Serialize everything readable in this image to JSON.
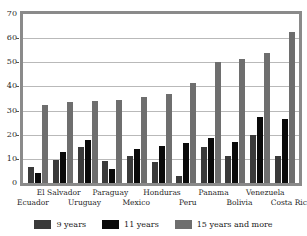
{
  "chart_data": {
    "type": "bar",
    "title": "",
    "subtitle": "",
    "xlabel": "",
    "ylabel": "",
    "ylim": [
      0,
      70
    ],
    "yticks": [
      0,
      10,
      20,
      30,
      40,
      50,
      60,
      70
    ],
    "grid": true,
    "legend_position": "bottom",
    "categories": [
      "Ecuador",
      "El Salvador",
      "Uruguay",
      "Paraguay",
      "Mexico",
      "Honduras",
      "Peru",
      "Panama",
      "Bolivia",
      "Venezuela",
      "Costa Rica"
    ],
    "series": [
      {
        "name": "9 years",
        "color": "#3a3a3a",
        "values": [
          6.5,
          9.5,
          15,
          9,
          11,
          8.5,
          3,
          15,
          11,
          20,
          11
        ]
      },
      {
        "name": "11 years",
        "color": "#0a0a0a",
        "values": [
          4,
          13,
          18,
          6,
          14,
          15.5,
          16.5,
          18.5,
          17,
          27.5,
          26.5
        ]
      },
      {
        "name": "15 years and more",
        "color": "#6e6e6e",
        "values": [
          32.5,
          33.5,
          34,
          34.5,
          35.5,
          37,
          41.5,
          50,
          51.5,
          54,
          62.5
        ]
      }
    ]
  },
  "axes": {
    "y_tick_labels": [
      "70",
      "60",
      "50",
      "40",
      "30",
      "20",
      "10",
      "0"
    ]
  },
  "legend": {
    "items": [
      {
        "label": "9 years",
        "swatch": "s0"
      },
      {
        "label": "11 years",
        "swatch": "s1"
      },
      {
        "label": "15 years and more",
        "swatch": "s2"
      }
    ]
  }
}
